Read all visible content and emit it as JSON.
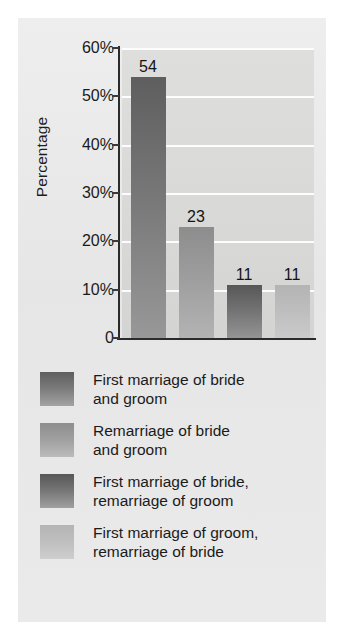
{
  "chart_data": {
    "type": "bar",
    "title": "",
    "xlabel": "",
    "ylabel": "Percentage",
    "ylim": [
      0,
      60
    ],
    "grid": true,
    "legend_position": "below",
    "categories": [
      "First marriage of bride and groom",
      "Remarriage of bride and groom",
      "First marriage of bride, remarriage of groom",
      "First marriage of groom, remarriage of bride"
    ],
    "values": [
      54,
      23,
      11,
      11
    ],
    "value_labels": [
      "54",
      "23",
      "11",
      "11"
    ],
    "ytick_labels": [
      "60%",
      "50%",
      "40%",
      "30%",
      "20%",
      "10%",
      "0"
    ],
    "ytick_values": [
      60,
      50,
      40,
      30,
      20,
      10,
      0
    ],
    "series_colors": [
      "#5e5e5e",
      "#8d8d8d",
      "#575757",
      "#b4b4b4"
    ]
  },
  "legend": {
    "entries": [
      {
        "line1": "First marriage of bride",
        "line2": "and groom",
        "color": "#5e5e5e"
      },
      {
        "line1": "Remarriage of bride",
        "line2": "and groom",
        "color": "#8d8d8d"
      },
      {
        "line1": "First marriage of bride,",
        "line2": "remarriage of groom",
        "color": "#575757"
      },
      {
        "line1": "First marriage of groom,",
        "line2": "remarriage of bride",
        "color": "#b4b4b4"
      }
    ]
  },
  "colors": {
    "panel_background": "#e9e9e9",
    "plot_background": "#d9d9d8",
    "gridline": "#fdfdfd",
    "axis": "#2b2b2b",
    "text": "#1a1a1a"
  }
}
